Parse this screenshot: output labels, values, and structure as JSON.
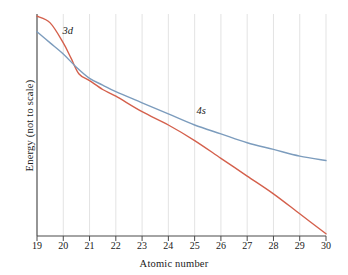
{
  "chart_data": {
    "type": "line",
    "title": "",
    "xlabel": "Atomic number",
    "ylabel": "Energy (not to scale)",
    "xlim": [
      19,
      30
    ],
    "ylim": [
      0,
      100
    ],
    "grid": true,
    "grid_axis": "x",
    "legend_position": "inline-annotation",
    "xticks": [
      19,
      20,
      21,
      22,
      23,
      24,
      25,
      26,
      27,
      28,
      29,
      30
    ],
    "xtick_labels": [
      "19",
      "20",
      "21",
      "22",
      "23",
      "24",
      "25",
      "26",
      "27",
      "28",
      "29",
      "30"
    ],
    "yticks": [],
    "ytick_labels": [],
    "annotations": [
      {
        "text": "3d",
        "x": 20.2,
        "y": 92,
        "style": "italic"
      },
      {
        "text": "4s",
        "x": 25.3,
        "y": 56,
        "style": "italic"
      }
    ],
    "series": [
      {
        "name": "3d",
        "color": "#d4604c",
        "x": [
          19,
          19.5,
          20,
          20.3,
          20.6,
          21,
          21.5,
          22,
          23,
          24,
          25,
          26,
          27,
          28,
          29,
          30
        ],
        "values": [
          99,
          96,
          87,
          80,
          73,
          70,
          66,
          63,
          56,
          50,
          43,
          35,
          27,
          19,
          10,
          1
        ]
      },
      {
        "name": "4s",
        "color": "#7c9cbd",
        "x": [
          19,
          19.5,
          20,
          20.5,
          21,
          21.5,
          22,
          23,
          24,
          25,
          26,
          27,
          28,
          29,
          30
        ],
        "values": [
          92,
          87,
          82,
          76,
          71,
          68,
          65,
          60,
          55,
          50,
          46,
          42,
          39,
          36,
          34
        ]
      }
    ]
  },
  "axis": {
    "x_title": "Atomic number",
    "y_title": "Energy (not to scale)"
  },
  "colors": {
    "series_3d": "#d4604c",
    "series_4s": "#7c9cbd",
    "gridline": "#dcdcdc",
    "axis": "#4a4a4a",
    "text": "#1a1a1a",
    "background": "#ffffff"
  },
  "labels": {
    "label_3d": "3d",
    "label_4s": "4s"
  },
  "ticks": {
    "x": [
      "19",
      "20",
      "21",
      "22",
      "23",
      "24",
      "25",
      "26",
      "27",
      "28",
      "29",
      "30"
    ]
  }
}
